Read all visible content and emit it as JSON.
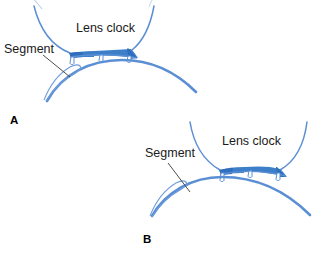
{
  "figure": {
    "background_color": "#ffffff",
    "width": 317,
    "height": 253,
    "colors": {
      "curve_blue": "#5b8fd4",
      "fill_blue": "#3d7ec9",
      "fill_blue_dark": "#2f6dbd",
      "thin_line_blue": "#6f9ddb",
      "leader_line": "#3a3a3a",
      "text": "#1a1a1a"
    }
  },
  "panels": [
    {
      "id": "A",
      "letter": "A",
      "labels": {
        "lens_clock": "Lens clock",
        "segment": "Segment"
      }
    },
    {
      "id": "B",
      "letter": "B",
      "labels": {
        "lens_clock": "Lens clock",
        "segment": "Segment"
      }
    }
  ]
}
